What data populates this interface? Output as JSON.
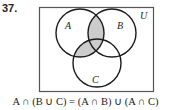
{
  "problem": {
    "number": "37."
  },
  "diagram": {
    "type": "venn-3-set",
    "universe_label": "U",
    "sets": [
      {
        "label": "A",
        "cx": 80,
        "cy": 33,
        "r": 24
      },
      {
        "label": "B",
        "cx": 112,
        "cy": 33,
        "r": 24
      },
      {
        "label": "C",
        "cx": 97,
        "cy": 63,
        "r": 24
      }
    ],
    "shaded_region": "A ∩ (B ∪ C)",
    "colors": {
      "shade": "#cccccc",
      "stroke": "#1a1a1a",
      "frame": "#555555"
    }
  },
  "caption": {
    "text": "A ∩ (B ∪ C) = (A ∩ B) ∪ (A ∩ C)"
  }
}
